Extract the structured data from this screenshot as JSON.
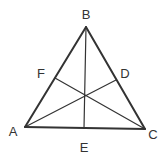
{
  "diagram": {
    "type": "triangle-with-cevians",
    "stroke_color": "#333333",
    "vertices": {
      "A": {
        "label": "A",
        "x": 25,
        "y": 127
      },
      "B": {
        "label": "B",
        "x": 86,
        "y": 27
      },
      "C": {
        "label": "C",
        "x": 145,
        "y": 129
      }
    },
    "points": {
      "D": {
        "label": "D",
        "x": 116,
        "y": 80,
        "on": "BC"
      },
      "E": {
        "label": "E",
        "x": 84,
        "y": 128,
        "on": "AC"
      },
      "F": {
        "label": "F",
        "x": 55,
        "y": 78,
        "on": "AB"
      }
    },
    "segments": [
      {
        "from": "A",
        "to": "B"
      },
      {
        "from": "B",
        "to": "C"
      },
      {
        "from": "A",
        "to": "C"
      },
      {
        "from": "A",
        "to": "D"
      },
      {
        "from": "B",
        "to": "E"
      },
      {
        "from": "C",
        "to": "F"
      }
    ],
    "labels": {
      "A": {
        "text": "A",
        "x": 13,
        "y": 131
      },
      "B": {
        "text": "B",
        "x": 86,
        "y": 14
      },
      "C": {
        "text": "C",
        "x": 153,
        "y": 134
      },
      "D": {
        "text": "D",
        "x": 125,
        "y": 73
      },
      "E": {
        "text": "E",
        "x": 84,
        "y": 147
      },
      "F": {
        "text": "F",
        "x": 41,
        "y": 73
      }
    }
  }
}
